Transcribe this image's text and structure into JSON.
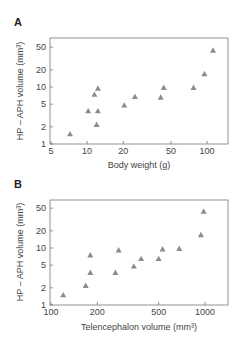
{
  "chart_data": [
    {
      "type": "scatter",
      "panel": "A",
      "title": "",
      "xlabel": "Body weight (g)",
      "ylabel": "HP – APH volume (mm³)",
      "xscale": "log",
      "yscale": "log",
      "xlim": [
        5,
        130
      ],
      "ylim": [
        1,
        80
      ],
      "xticks": [
        5,
        10,
        20,
        50,
        100
      ],
      "xtick_labels": [
        "5",
        "10",
        "20",
        "50",
        "100"
      ],
      "yticks": [
        1,
        2,
        5,
        10,
        20,
        50
      ],
      "ytick_labels": [
        "1",
        "2",
        "5",
        "10",
        "20",
        "50"
      ],
      "marker": "triangle",
      "marker_color": "#8c8c8c",
      "grid": false,
      "points": [
        {
          "x": 7.2,
          "y": 1.5
        },
        {
          "x": 10.2,
          "y": 3.8
        },
        {
          "x": 11.5,
          "y": 7.4
        },
        {
          "x": 12.3,
          "y": 9.5
        },
        {
          "x": 12.3,
          "y": 3.8
        },
        {
          "x": 12.0,
          "y": 2.2
        },
        {
          "x": 20.4,
          "y": 4.8
        },
        {
          "x": 25.0,
          "y": 6.8
        },
        {
          "x": 41.0,
          "y": 6.6
        },
        {
          "x": 43.5,
          "y": 9.8
        },
        {
          "x": 77.0,
          "y": 9.8
        },
        {
          "x": 95.0,
          "y": 17.0
        },
        {
          "x": 112.0,
          "y": 44.0
        }
      ]
    },
    {
      "type": "scatter",
      "panel": "B",
      "title": "",
      "xlabel": "Telencephalon volume (mm³)",
      "ylabel": "HP – APH volume (mm³)",
      "xscale": "log",
      "yscale": "log",
      "xlim": [
        100,
        1350
      ],
      "ylim": [
        1,
        80
      ],
      "xticks": [
        100,
        200,
        500,
        1000
      ],
      "xtick_labels": [
        "100",
        "200",
        "500",
        "1000"
      ],
      "yticks": [
        1,
        2,
        5,
        10,
        20,
        50
      ],
      "ytick_labels": [
        "1",
        "2",
        "5",
        "10",
        "20",
        "50"
      ],
      "marker": "triangle",
      "marker_color": "#8c8c8c",
      "grid": false,
      "points": [
        {
          "x": 120,
          "y": 1.5
        },
        {
          "x": 168,
          "y": 2.2
        },
        {
          "x": 180,
          "y": 3.7
        },
        {
          "x": 180,
          "y": 7.5
        },
        {
          "x": 262,
          "y": 3.7
        },
        {
          "x": 275,
          "y": 9.2
        },
        {
          "x": 345,
          "y": 4.8
        },
        {
          "x": 385,
          "y": 6.5
        },
        {
          "x": 500,
          "y": 6.5
        },
        {
          "x": 530,
          "y": 9.6
        },
        {
          "x": 680,
          "y": 9.8
        },
        {
          "x": 940,
          "y": 17.0
        },
        {
          "x": 980,
          "y": 44.0
        }
      ]
    }
  ],
  "panels": {
    "a": {
      "label": "A",
      "xlabel": "Body weight (g)",
      "ylabel": "HP – APH volume (mm³)"
    },
    "b": {
      "label": "B",
      "xlabel": "Telencephalon volume (mm³)",
      "ylabel": "HP – APH volume (mm³)"
    }
  }
}
